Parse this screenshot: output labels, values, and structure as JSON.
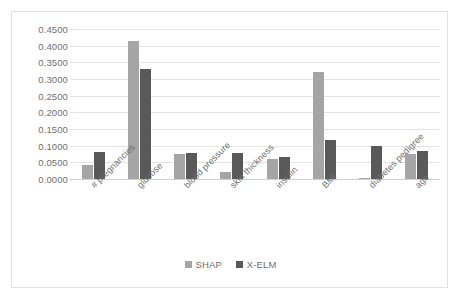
{
  "chart_data": {
    "type": "bar",
    "title": "",
    "xlabel": "",
    "ylabel": "",
    "categories": [
      "# pregnancies",
      "glucose",
      "blood pressure",
      "skin thickness",
      "insulin",
      "BMI",
      "diabetes pedigree",
      "age"
    ],
    "series": [
      {
        "name": "SHAP",
        "color": "#A5A5A5",
        "values": [
          0.042,
          0.413,
          0.075,
          0.02,
          0.06,
          0.32,
          0.002,
          0.075
        ]
      },
      {
        "name": "X-ELM",
        "color": "#595959",
        "values": [
          0.08,
          0.33,
          0.077,
          0.078,
          0.065,
          0.118,
          0.1,
          0.085
        ]
      }
    ],
    "ylim": [
      0.0,
      0.45
    ],
    "ytick_step": 0.05,
    "ytick_labels": [
      "0.0000",
      "0.0500",
      "0.1000",
      "0.1500",
      "0.2000",
      "0.2500",
      "0.3000",
      "0.3500",
      "0.4000",
      "0.4500"
    ],
    "grid": true,
    "legend_position": "bottom"
  }
}
